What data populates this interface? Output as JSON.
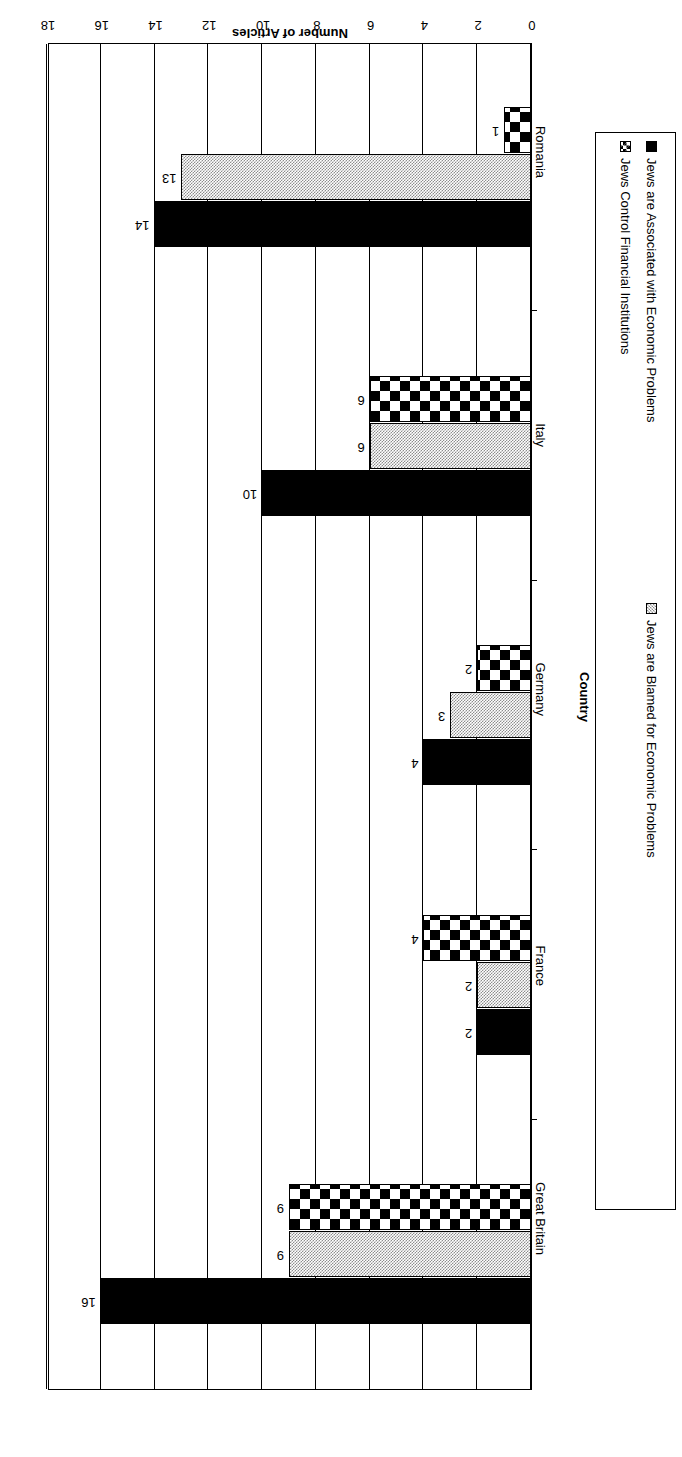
{
  "chart_data": {
    "type": "bar",
    "orientation": "horizontal",
    "title": "",
    "xlabel": "Country",
    "ylabel": "Number of Articles",
    "categories": [
      "Great Britain",
      "France",
      "Germany",
      "Italy",
      "Romania"
    ],
    "series": [
      {
        "name": "Jews are Associated with Economic Problems",
        "values": [
          16,
          2,
          4,
          10,
          14
        ],
        "pattern": "solid-black",
        "color": "#000000"
      },
      {
        "name": "Jews are Blamed for Economic Problems",
        "values": [
          9,
          2,
          3,
          6,
          13
        ],
        "pattern": "gray-50-dither",
        "color": "#a8a8a8"
      },
      {
        "name": "Jews Control Financial Institutions",
        "values": [
          9,
          4,
          2,
          6,
          1
        ],
        "pattern": "black-diamond-checker",
        "color": "#000000"
      }
    ],
    "value_axis": {
      "ticks": [
        0,
        2,
        4,
        6,
        8,
        10,
        12,
        14,
        16,
        18
      ],
      "tick_labels": [
        "0",
        "2",
        "4",
        "6",
        "8",
        "10",
        "12",
        "14",
        "16",
        "18"
      ],
      "min": 0,
      "max": 18,
      "grid": true
    },
    "data_labels": {
      "Great Britain": [
        "16",
        "9",
        "9"
      ],
      "France": [
        "2",
        "2",
        "4"
      ],
      "Germany": [
        "4",
        "3",
        "2"
      ],
      "Italy": [
        "10",
        "6",
        "6"
      ],
      "Romania": [
        "14",
        "13",
        "1"
      ]
    },
    "legend": {
      "position": "right",
      "entries": [
        "Jews are Associated with Economic Problems",
        "Jews Control Financial Institutions",
        "Jews are Blamed for Economic Problems"
      ]
    },
    "orientation_note": "figure rendered upside-down (rotated 180 degrees)"
  }
}
